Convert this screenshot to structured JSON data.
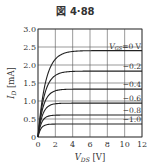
{
  "figure": {
    "title": "図 4·88"
  },
  "chart_data": {
    "type": "line",
    "title": "図 4·88",
    "xlabel": "V_DS [V]",
    "ylabel": "I_D [mA]",
    "xlim": [
      0,
      12
    ],
    "ylim": [
      0,
      3.0
    ],
    "xticks": [
      "0",
      "2",
      "4",
      "6",
      "8",
      "10",
      "12"
    ],
    "yticks": [
      "0",
      "0.5",
      "1.0",
      "1.5",
      "2.0",
      "2.5",
      "3.0"
    ],
    "grid": true,
    "series": [
      {
        "name": "V_GS=0 V",
        "label": "V_GS=0 V",
        "saturation": 2.4,
        "knee": 2.6
      },
      {
        "name": "-0.2",
        "label": "−0.2",
        "saturation": 1.83,
        "knee": 2.2
      },
      {
        "name": "-0.4",
        "label": "−0.4",
        "saturation": 1.33,
        "knee": 1.8
      },
      {
        "name": "-0.6",
        "label": "−0.6",
        "saturation": 0.94,
        "knee": 1.5
      },
      {
        "name": "-0.8",
        "label": "−0.8",
        "saturation": 0.61,
        "knee": 1.2
      },
      {
        "name": "-1.0",
        "label": "−1.0",
        "saturation": 0.36,
        "knee": 1.0
      }
    ]
  }
}
